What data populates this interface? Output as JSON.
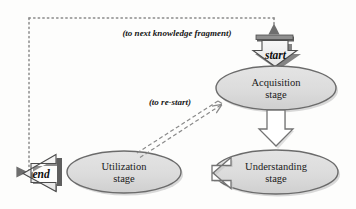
{
  "diagram": {
    "background_color": "#fdfdfc",
    "nodes": [
      {
        "id": "acquisition",
        "label_line1": "Acquisition",
        "label_line2": "stage",
        "shape": "ellipse",
        "fill": "#dcdcdc",
        "stroke": "#6b6b6b"
      },
      {
        "id": "understanding",
        "label_line1": "Understanding",
        "label_line2": "stage",
        "shape": "ellipse",
        "fill": "#dcdcdc",
        "stroke": "#6b6b6b"
      },
      {
        "id": "utilization",
        "label_line1": "Utilization",
        "label_line2": "stage",
        "shape": "ellipse",
        "fill": "#dcdcdc",
        "stroke": "#6b6b6b"
      }
    ],
    "terminals": [
      {
        "id": "start",
        "label": "start",
        "direction": "down",
        "fill": "#f2f2f2",
        "stroke": "#4d4d4d",
        "shadow": "#5a5a5a"
      },
      {
        "id": "end",
        "label": "end",
        "direction": "left",
        "fill": "#f2f2f2",
        "stroke": "#4d4d4d",
        "shadow": "#5a5a5a"
      }
    ],
    "annotations": [
      {
        "id": "next-fragment",
        "text": "(to next knowledge fragment)"
      },
      {
        "id": "re-start",
        "text": "(to re-start)"
      }
    ],
    "connectors": [
      {
        "id": "acquisition-to-understanding",
        "style": "block-arrow",
        "direction": "down",
        "fill": "#ffffff",
        "stroke": "#737373"
      },
      {
        "id": "understanding-to-utilization",
        "style": "block-arrow",
        "direction": "left",
        "fill": "#ffffff",
        "stroke": "#737373"
      },
      {
        "id": "utilization-to-acquisition",
        "style": "dashed-double-line",
        "direction": "up-right",
        "stroke": "#8a8a8a"
      },
      {
        "id": "feedback-loop",
        "style": "dotted-line",
        "direction": "loop",
        "stroke": "#8a8a8a"
      }
    ]
  }
}
